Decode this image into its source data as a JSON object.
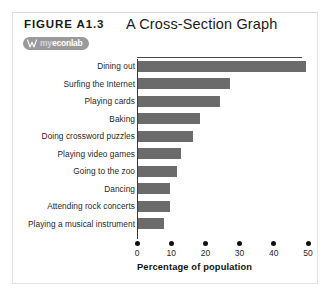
{
  "figure": {
    "number": "FIGURE A1.3",
    "title": "A Cross-Section Graph",
    "logo": {
      "icon": "myeconlab-logo-icon",
      "prefix": "my",
      "word": "econlab"
    }
  },
  "chart_data": {
    "type": "bar",
    "orientation": "horizontal",
    "title": "A Cross-Section Graph",
    "xlabel": "Percentage of population",
    "ylabel": "",
    "xlim": [
      0,
      50
    ],
    "xticks": [
      0,
      10,
      20,
      30,
      40,
      50
    ],
    "grid": false,
    "legend": null,
    "bar_color": "#6b6b6b",
    "categories": [
      "Dining out",
      "Surfing the Internet",
      "Playing cards",
      "Baking",
      "Doing crossword puzzles",
      "Playing video games",
      "Going to the zoo",
      "Dancing",
      "Attending rock concerts",
      "Playing a musical instrument"
    ],
    "values": [
      49,
      27,
      24,
      18,
      16,
      12.5,
      11.5,
      9.5,
      9.5,
      7.5
    ]
  }
}
